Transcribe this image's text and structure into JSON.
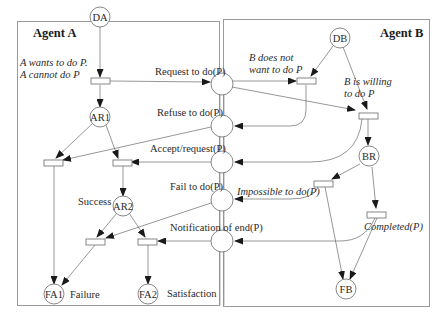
{
  "agents": {
    "a": {
      "title": "Agent A"
    },
    "b": {
      "title": "Agent B"
    }
  },
  "places": {
    "DA": "DA",
    "AR1": "AR1",
    "AR2": "AR2",
    "FA1": "FA1",
    "FA2": "FA2",
    "DB": "DB",
    "BR": "BR",
    "FB": "FB"
  },
  "messages": {
    "request": "Request to do(P)",
    "refuse": "Refuse to do(P)",
    "accept": "Accept/request(P)",
    "fail": "Fail to do(P)",
    "notification": "Notification of end(P)"
  },
  "annotations": {
    "a_wants_line1": "A wants to do P.",
    "a_wants_line2": "A cannot do P",
    "b_not_line1": "B does not",
    "b_not_line2": "want to do P",
    "b_willing_line1": "B is willing",
    "b_willing_line2": "to do P",
    "impossible": "Impossible to do(P)",
    "completed": "Completed(P)",
    "success": "Success",
    "failure": "Failure",
    "satisfaction": "Satisfaction"
  },
  "colors": {
    "stroke": "#6a6a6a",
    "border": "#9a9a9a",
    "text": "#2a2a2a"
  }
}
